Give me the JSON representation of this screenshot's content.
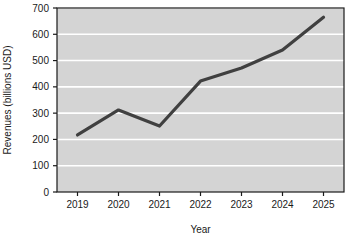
{
  "chart_data": {
    "type": "line",
    "title": "",
    "xlabel": "Year",
    "ylabel": "Revenues (billions USD)",
    "categories": [
      "2019",
      "2020",
      "2021",
      "2022",
      "2023",
      "2024",
      "2025"
    ],
    "values": [
      217,
      312,
      251,
      422,
      472,
      540,
      665
    ],
    "series": [
      {
        "name": "Revenues",
        "values": [
          217,
          312,
          251,
          422,
          472,
          540,
          665
        ]
      }
    ],
    "ylim": [
      0,
      700
    ],
    "ytick_labels": [
      "0",
      "100",
      "200",
      "300",
      "400",
      "500",
      "600",
      "700"
    ],
    "ytick_values": [
      0,
      100,
      200,
      300,
      400,
      500,
      600,
      700
    ],
    "xtick_labels": [
      "2019",
      "2020",
      "2021",
      "2022",
      "2023",
      "2024",
      "2025"
    ],
    "grid": "horizontal",
    "legend": "none",
    "markers": "none",
    "colors": {
      "line": "#404040",
      "plot_background": "#d4d4d4",
      "gridline": "#ffffff",
      "axis": "#1a1a1a",
      "figure_background": "#ffffff",
      "text": "#1a1a1a"
    }
  }
}
